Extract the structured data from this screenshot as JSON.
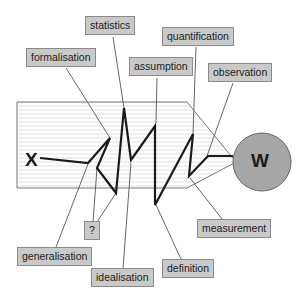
{
  "diagram": {
    "start_node": "X",
    "end_node": "W",
    "labels": {
      "statistics": "statistics",
      "formalisation": "formalisation",
      "assumption": "assumption",
      "quantification": "quantification",
      "observation": "observation",
      "question": "?",
      "generalisation": "generalisation",
      "idealisation": "idealisation",
      "definition": "definition",
      "measurement": "measurement"
    },
    "colors": {
      "label_fill": "#c9c9c9",
      "circle_fill": "#a6a6a6",
      "path": "#1a1a1a",
      "leader": "#555555"
    }
  }
}
